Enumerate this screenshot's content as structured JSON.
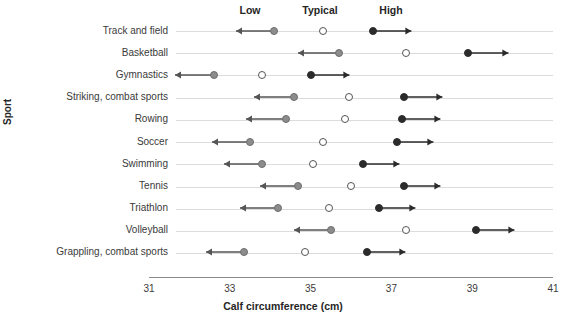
{
  "header": {
    "low_label": "Low",
    "typical_label": "Typical",
    "high_label": "High"
  },
  "axes": {
    "xlabel": "Calf circumference (cm)",
    "ylabel": "Sport",
    "xticks": [
      "31",
      "33",
      "35",
      "37",
      "39",
      "41"
    ]
  },
  "colors": {
    "low": "#8c8c8c",
    "typical": "#ffffff",
    "high": "#2b2b2b",
    "rowline": "#dcdcdc",
    "axis": "#8a8a8a"
  },
  "chart_data": {
    "type": "scatter",
    "title": "",
    "xlabel": "Calf circumference (cm)",
    "ylabel": "Sport",
    "xlim": [
      31,
      41
    ],
    "xticks": [
      31,
      33,
      35,
      37,
      39,
      41
    ],
    "grid": false,
    "legend": [
      "Low",
      "Typical",
      "High"
    ],
    "legend_position": "top",
    "categories": [
      "Track and field",
      "Basketball",
      "Gymnastics",
      "Striking, combat sports",
      "Rowing",
      "Soccer",
      "Swimming",
      "Tennis",
      "Triathlon",
      "Volleyball",
      "Grappling, combat sports"
    ],
    "series": [
      {
        "name": "Low",
        "marker": "filled-gray-circle-with-left-arrow",
        "values": [
          34.1,
          35.7,
          32.6,
          34.6,
          34.4,
          33.5,
          33.8,
          34.7,
          34.2,
          35.5,
          33.35
        ],
        "arrow_ends": [
          33.15,
          34.7,
          31.65,
          33.6,
          33.4,
          32.55,
          32.85,
          33.75,
          33.25,
          34.6,
          32.4
        ]
      },
      {
        "name": "Typical",
        "marker": "open-circle",
        "values": [
          35.3,
          37.35,
          33.8,
          35.95,
          35.85,
          35.3,
          35.05,
          36.0,
          35.45,
          37.35,
          34.85
        ]
      },
      {
        "name": "High",
        "marker": "filled-black-circle-with-right-arrow",
        "values": [
          36.55,
          38.9,
          35.0,
          37.3,
          37.25,
          37.15,
          36.3,
          37.3,
          36.7,
          39.1,
          36.4
        ],
        "arrow_ends": [
          37.5,
          39.9,
          35.95,
          38.25,
          38.2,
          38.05,
          37.2,
          38.2,
          37.6,
          40.05,
          37.35
        ]
      }
    ]
  }
}
